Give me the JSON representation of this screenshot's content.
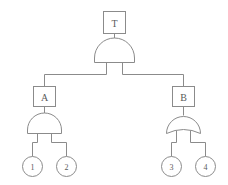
{
  "diagram": {
    "type": "fault-tree",
    "title": "",
    "line_color": "#8b8b8b",
    "text_color": "#5a5a5a",
    "background": "#ffffff",
    "top_event": {
      "id": "T",
      "label": "T",
      "shape": "rectangle",
      "gate_below": "AND"
    },
    "intermediate_events": [
      {
        "id": "A",
        "label": "A",
        "shape": "rectangle",
        "gate_below": "AND",
        "side": "left"
      },
      {
        "id": "B",
        "label": "B",
        "shape": "rectangle",
        "gate_below": "OR",
        "side": "right"
      }
    ],
    "basic_events": [
      {
        "id": "1",
        "label": "1",
        "shape": "circle",
        "parent": "A"
      },
      {
        "id": "2",
        "label": "2",
        "shape": "circle",
        "parent": "A"
      },
      {
        "id": "3",
        "label": "3",
        "shape": "circle",
        "parent": "B"
      },
      {
        "id": "4",
        "label": "4",
        "shape": "circle",
        "parent": "B"
      }
    ],
    "gates": [
      {
        "id": "gate-top",
        "type": "AND",
        "output_to": "T",
        "inputs": [
          "A",
          "B"
        ]
      },
      {
        "id": "gate-a",
        "type": "AND",
        "output_to": "A",
        "inputs": [
          "1",
          "2"
        ]
      },
      {
        "id": "gate-b",
        "type": "OR",
        "output_to": "B",
        "inputs": [
          "3",
          "4"
        ]
      }
    ]
  }
}
